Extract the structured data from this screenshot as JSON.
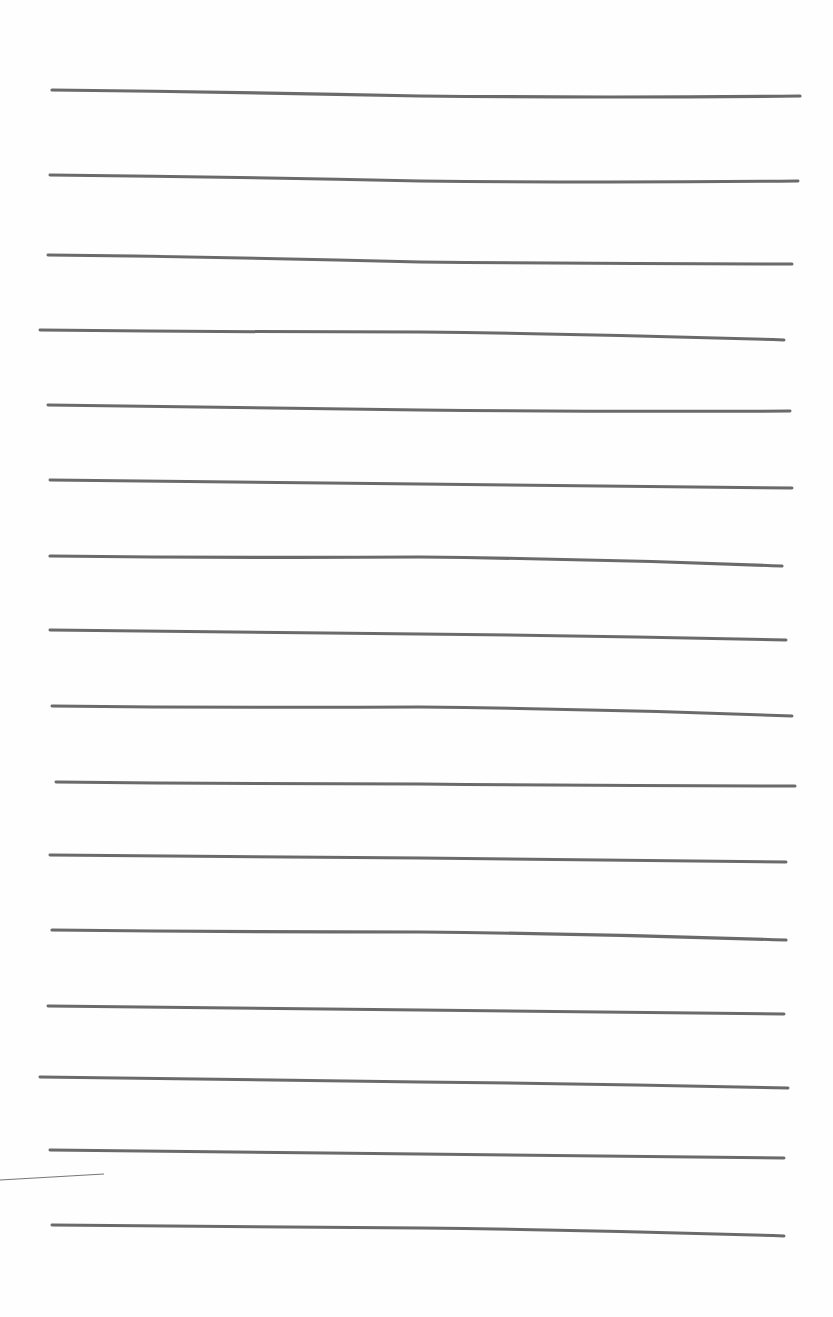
{
  "document": {
    "type": "lined-paper",
    "text_content": "",
    "line_color": "#5a5a5a",
    "background_color": "#fefefe"
  },
  "ruled_lines": [
    {
      "x1": 52,
      "y1": 90,
      "xm": 420,
      "ym": 96,
      "x2": 800,
      "y2": 96,
      "w": 3.2
    },
    {
      "x1": 50,
      "y1": 175,
      "xm": 420,
      "ym": 181,
      "x2": 798,
      "y2": 181,
      "w": 3.0
    },
    {
      "x1": 48,
      "y1": 255,
      "xm": 420,
      "ym": 262,
      "x2": 792,
      "y2": 264,
      "w": 3.0
    },
    {
      "x1": 40,
      "y1": 330,
      "xm": 420,
      "ym": 332,
      "x2": 784,
      "y2": 340,
      "w": 3.0
    },
    {
      "x1": 48,
      "y1": 405,
      "xm": 420,
      "ym": 410,
      "x2": 790,
      "y2": 411,
      "w": 3.0
    },
    {
      "x1": 50,
      "y1": 480,
      "xm": 420,
      "ym": 484,
      "x2": 792,
      "y2": 488,
      "w": 3.0
    },
    {
      "x1": 50,
      "y1": 556,
      "xm": 420,
      "ym": 557,
      "x2": 782,
      "y2": 566,
      "w": 3.2
    },
    {
      "x1": 50,
      "y1": 630,
      "xm": 420,
      "ym": 634,
      "x2": 786,
      "y2": 640,
      "w": 3.0
    },
    {
      "x1": 52,
      "y1": 706,
      "xm": 420,
      "ym": 707,
      "x2": 792,
      "y2": 716,
      "w": 3.0
    },
    {
      "x1": 56,
      "y1": 782,
      "xm": 420,
      "ym": 784,
      "x2": 795,
      "y2": 786,
      "w": 3.0
    },
    {
      "x1": 50,
      "y1": 855,
      "xm": 420,
      "ym": 858,
      "x2": 786,
      "y2": 862,
      "w": 3.0
    },
    {
      "x1": 52,
      "y1": 930,
      "xm": 420,
      "ym": 932,
      "x2": 786,
      "y2": 940,
      "w": 3.2
    },
    {
      "x1": 48,
      "y1": 1006,
      "xm": 420,
      "ym": 1010,
      "x2": 784,
      "y2": 1014,
      "w": 3.0
    },
    {
      "x1": 40,
      "y1": 1077,
      "xm": 420,
      "ym": 1082,
      "x2": 788,
      "y2": 1088,
      "w": 3.0
    },
    {
      "x1": 50,
      "y1": 1150,
      "xm": 420,
      "ym": 1154,
      "x2": 784,
      "y2": 1158,
      "w": 3.0
    },
    {
      "x1": 52,
      "y1": 1225,
      "xm": 420,
      "ym": 1228,
      "x2": 784,
      "y2": 1236,
      "w": 3.0
    }
  ],
  "stray_mark": {
    "x1": 0,
    "y1": 1180,
    "x2": 104,
    "y2": 1174,
    "w": 1.2
  }
}
